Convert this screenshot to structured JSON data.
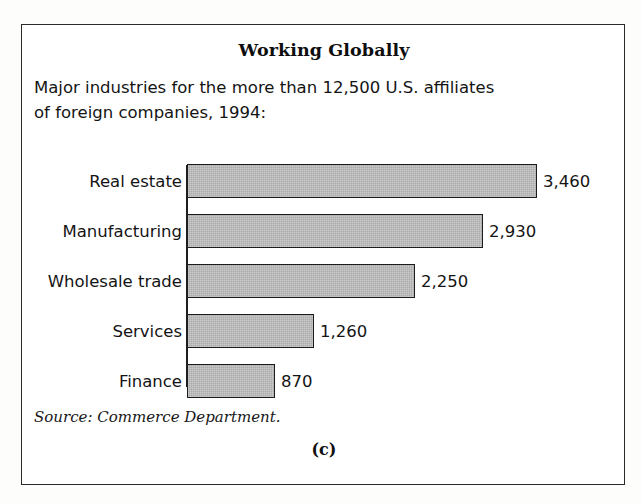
{
  "figure": {
    "title": "Working Globally",
    "subtitle_line1": "Major industries for the more than 12,500 U.S. affiliates",
    "subtitle_line2": "of foreign companies, 1994:",
    "source": "Source: Commerce Department.",
    "panel_letter": "(c)",
    "bar_fill_color": "#a9a9a9",
    "bar_border_color": "#1c1c1c",
    "frame_color": "#2a2a2a"
  },
  "chart_data": {
    "type": "bar",
    "orientation": "horizontal",
    "title": "Working Globally",
    "subtitle": "Major industries for the more than 12,500 U.S. affiliates of foreign companies, 1994:",
    "xlabel": "",
    "ylabel": "",
    "grid": false,
    "legend": false,
    "axis_range": [
      0,
      3460
    ],
    "source": "Source: Commerce Department.",
    "categories": [
      "Real estate",
      "Manufacturing",
      "Wholesale trade",
      "Services",
      "Finance"
    ],
    "values": [
      3460,
      2930,
      2250,
      1260,
      870
    ],
    "value_labels": [
      "3,460",
      "2,930",
      "2,250",
      "1,260",
      "870"
    ],
    "bars": [
      {
        "category": "Real estate",
        "value": 3460,
        "label": "3,460"
      },
      {
        "category": "Manufacturing",
        "value": 2930,
        "label": "2,930"
      },
      {
        "category": "Wholesale trade",
        "value": 2250,
        "label": "2,250"
      },
      {
        "category": "Services",
        "value": 1260,
        "label": "1,260"
      },
      {
        "category": "Finance",
        "value": 870,
        "label": "870"
      }
    ]
  }
}
